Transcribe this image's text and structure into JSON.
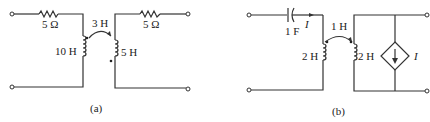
{
  "circuit_a": {
    "caption": "(a)",
    "left_resistor": "5 Ω",
    "right_resistor": "5 Ω",
    "mutual_inductance": "3 H",
    "primary_inductor": "10 H",
    "secondary_inductor": "5 H"
  },
  "circuit_b": {
    "caption": "(b)",
    "capacitor": "1 F",
    "current_label": "I",
    "mutual_inductance": "1 H",
    "primary_inductor": "2 H",
    "secondary_inductor": "2 H",
    "dependent_source_label": "I"
  }
}
